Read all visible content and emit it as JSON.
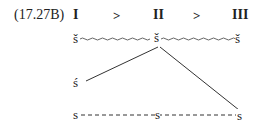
{
  "example_label": "(17.27B)",
  "header": {
    "stages": [
      "I",
      "II",
      "III"
    ],
    "relations": [
      ">",
      ">"
    ]
  },
  "rows": {
    "top": [
      "š",
      "š",
      "š"
    ],
    "middle": [
      "ś"
    ],
    "bottom": [
      "s",
      "s",
      "s"
    ]
  },
  "connections": [
    {
      "from": "top.0",
      "to": "top.2",
      "style": "wavy"
    },
    {
      "from": "middle.0",
      "to": "top.1",
      "style": "solid"
    },
    {
      "from": "top.1",
      "to": "bottom.2",
      "style": "solid"
    },
    {
      "from": "bottom.0",
      "to": "bottom.2",
      "style": "dashed"
    }
  ],
  "colors": {
    "ink": "#222222",
    "background": "#ffffff"
  }
}
